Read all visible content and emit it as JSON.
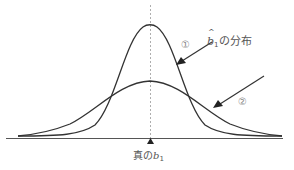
{
  "diagram": {
    "distribution_label": {
      "symbol": "b",
      "subscript": "1",
      "suffix": "の分布"
    },
    "curve_labels": [
      "①",
      "②"
    ],
    "true_value_label": {
      "prefix": "真の",
      "symbol": "b",
      "subscript": "1"
    },
    "colors": {
      "curve": "#333333",
      "axis": "#555555",
      "dashed_line": "#999999",
      "text": "#555555"
    },
    "curves": [
      {
        "name": "①",
        "description": "narrow, tall normal curve centered on true b1"
      },
      {
        "name": "②",
        "description": "wide, flat normal curve centered on true b1"
      }
    ]
  }
}
